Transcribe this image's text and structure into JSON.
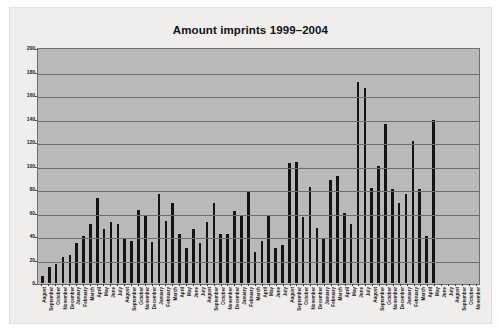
{
  "figure": {
    "background_color": "#efeeec",
    "plot_background_color": "#b9b9b9",
    "bar_color": "#131313",
    "gridline_color": "#6d6d6d",
    "axis_color": "#6f6f6f"
  },
  "chart_data": {
    "type": "bar",
    "title": "Amount imprints 1999–2004",
    "xlabel": "",
    "ylabel": "",
    "ylim": [
      0,
      200
    ],
    "yticks": [
      0,
      20,
      40,
      60,
      80,
      100,
      120,
      140,
      160,
      180,
      200
    ],
    "grid": true,
    "legend": null,
    "orientation": "vertical",
    "categories": [
      "August",
      "September",
      "October",
      "November",
      "December",
      "January",
      "February",
      "March",
      "April",
      "May",
      "June",
      "July",
      "August",
      "September",
      "October",
      "November",
      "December",
      "January",
      "February",
      "March",
      "April",
      "May",
      "June",
      "July",
      "August",
      "September",
      "October",
      "November",
      "December",
      "January",
      "February",
      "March",
      "April",
      "May",
      "June",
      "July",
      "August",
      "September",
      "October",
      "November",
      "December",
      "January",
      "February",
      "March",
      "April",
      "May",
      "June",
      "July",
      "August",
      "September",
      "October",
      "November",
      "December",
      "January",
      "February",
      "March",
      "April",
      "May",
      "June",
      "July",
      "August",
      "September",
      "October",
      "November"
    ],
    "values": [
      6,
      14,
      16,
      22,
      24,
      34,
      40,
      50,
      72,
      46,
      52,
      50,
      38,
      36,
      62,
      58,
      35,
      76,
      53,
      68,
      42,
      30,
      46,
      34,
      52,
      68,
      42,
      42,
      61,
      58,
      78,
      26,
      36,
      57,
      30,
      32,
      102,
      103,
      56,
      82,
      47,
      38,
      88,
      91,
      60,
      50,
      171,
      166,
      81,
      100,
      135,
      80,
      68,
      76,
      121,
      80,
      40,
      139,
      0,
      0,
      0,
      0,
      0,
      0
    ]
  }
}
